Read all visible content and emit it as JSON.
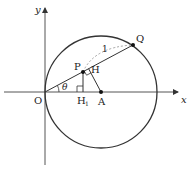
{
  "diagram": {
    "axes": {
      "x_label": "x",
      "y_label": "y"
    },
    "points": {
      "origin": "O",
      "center": "A",
      "p": "P",
      "q": "Q",
      "h": "H",
      "h1_main": "H",
      "h1_sub": "1"
    },
    "angle_label": "θ",
    "segment_label": "1",
    "colors": {
      "line": "#333333",
      "circle": "#333333",
      "dashed": "#999999",
      "point": "#111111"
    }
  }
}
